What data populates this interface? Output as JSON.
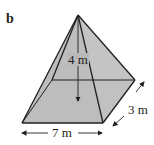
{
  "figure": {
    "part_label": "b",
    "shape": "square-based pyramid (rectangular base)",
    "dimensions": {
      "height": "4 m",
      "length": "7 m",
      "width": "3 m"
    },
    "colors": {
      "face_fill": "#bdbdbd",
      "stroke": "#231f20"
    }
  }
}
